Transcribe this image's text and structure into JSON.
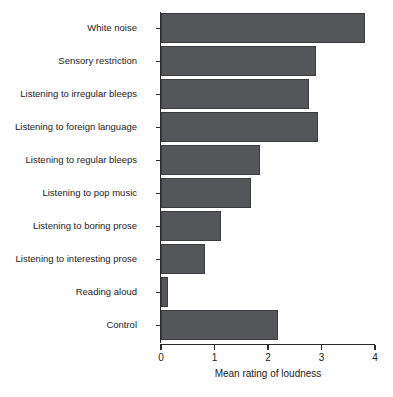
{
  "chart_data": {
    "type": "bar",
    "orientation": "horizontal",
    "title": "",
    "subtitle": "",
    "xlabel": "Mean rating of loudness",
    "ylabel": "",
    "xlim": [
      0,
      4
    ],
    "xticks": [
      "0",
      "1",
      "2",
      "3",
      "4"
    ],
    "grid": false,
    "legend": null,
    "bar_color": "#55565a",
    "bar_edge_color": "#3b3c40",
    "axis_color": "#2b2b2b",
    "categories": [
      "White noise",
      "Sensory restriction",
      "Listening to irregular bleeps",
      "Listening to foreign language",
      "Listening to regular bleeps",
      "Listening to pop music",
      "Listening to boring prose",
      "Listening to interesting prose",
      "Reading aloud",
      "Control"
    ],
    "values": [
      3.82,
      2.9,
      2.76,
      2.93,
      1.85,
      1.69,
      1.12,
      0.83,
      0.13,
      2.19
    ]
  }
}
